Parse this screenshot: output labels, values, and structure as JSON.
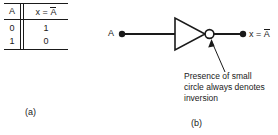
{
  "truth_table": {
    "headers": {
      "input": "A",
      "output_prefix": "x = ",
      "output_var": "A"
    },
    "rows": [
      {
        "input": "0",
        "output": "1"
      },
      {
        "input": "1",
        "output": "0"
      }
    ]
  },
  "gate": {
    "input_label": "A",
    "output_prefix": "x = ",
    "output_var": "A",
    "symbol_name": "inverter-triangle",
    "bubble_name": "inversion-bubble"
  },
  "annotation": {
    "line1": "Presence of small",
    "line2": "circle always denotes",
    "line3": "inversion"
  },
  "captions": {
    "a": "(a)",
    "b": "(b)"
  },
  "colors": {
    "ink": "#1a1a1a",
    "paper": "#ffffff"
  }
}
